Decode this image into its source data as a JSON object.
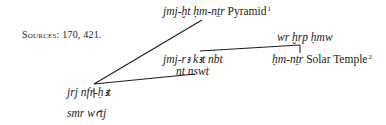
{
  "sources": {
    "label": "Sources:",
    "values": "170, 421."
  },
  "nodes": {
    "pyramid": {
      "title": "jmj-ḫt ḥm-nṯr",
      "place": "Pyramid",
      "note": "1"
    },
    "solar": {
      "title_top": "wr ḫrp ḥmw",
      "title": "ḥm-nṯr",
      "place": "Solar Temple",
      "note": "2"
    },
    "mid": {
      "line1": "jmj-rꜣ kꜣt nbt",
      "line2": "nt nswt"
    },
    "root": {
      "title": "jrj nfr-ḥꜣt",
      "sub": "smr wꜥtj"
    }
  },
  "lines": [
    {
      "from": [
        94,
        84
      ],
      "to": [
        202,
        20
      ]
    },
    {
      "from": [
        94,
        84
      ],
      "to": [
        195,
        74
      ]
    },
    {
      "from": [
        200,
        51
      ],
      "to": [
        300,
        45
      ]
    },
    {
      "from": [
        300,
        45
      ],
      "to": [
        300,
        53
      ]
    },
    {
      "from": [
        94,
        88
      ],
      "to": [
        94,
        98
      ]
    }
  ]
}
